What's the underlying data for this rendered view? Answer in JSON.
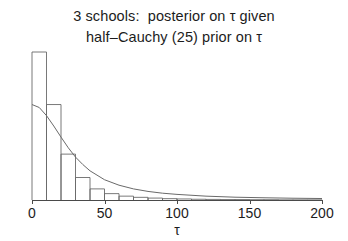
{
  "figure": {
    "title_line_1": "3 schools:  posterior on τ given",
    "title_line_2": "half–Cauchy (25) prior on τ",
    "background_color": "#ffffff",
    "line_color": "#6a6a6a",
    "axis_color": "#4a4a4a"
  },
  "chart_data": {
    "type": "bar",
    "title": "3 schools:  posterior on τ given half–Cauchy (25) prior on τ",
    "xlabel": "τ",
    "ylabel": "",
    "xlim": [
      0,
      200
    ],
    "ylim": [
      0,
      1
    ],
    "grid": false,
    "legend": "none",
    "xticks": [
      0,
      50,
      100,
      150,
      200
    ],
    "xtick_labels": [
      "0",
      "50",
      "100",
      "150",
      "200"
    ],
    "histogram": {
      "description": "posterior histogram of tau",
      "bin_width": 10,
      "bin_edges": [
        0,
        10,
        20,
        30,
        40,
        50,
        60,
        70,
        80,
        90,
        100,
        110,
        120,
        130,
        140,
        150,
        160,
        170,
        180,
        190,
        200
      ],
      "densities": [
        1.0,
        0.645,
        0.31,
        0.152,
        0.075,
        0.043,
        0.026,
        0.018,
        0.013,
        0.009,
        0.007,
        0.005,
        0.004,
        0.003,
        0.003,
        0.002,
        0.002,
        0.001,
        0.001,
        0.001
      ]
    },
    "prior_curve": {
      "name": "half-Cauchy (25) prior",
      "scale": 25,
      "x": [
        0,
        5,
        10,
        15,
        20,
        25,
        30,
        35,
        40,
        50,
        60,
        70,
        80,
        90,
        100,
        120,
        140,
        160,
        180,
        200
      ],
      "y": [
        0.645,
        0.625,
        0.57,
        0.5,
        0.425,
        0.353,
        0.29,
        0.24,
        0.197,
        0.137,
        0.1,
        0.075,
        0.058,
        0.046,
        0.038,
        0.026,
        0.019,
        0.015,
        0.012,
        0.01
      ]
    }
  },
  "axis": {
    "x_title": "τ"
  }
}
